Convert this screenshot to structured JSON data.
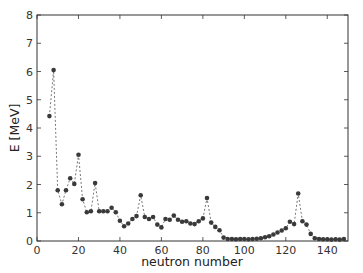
{
  "chart_data": {
    "type": "line",
    "title": "",
    "xlabel": "neutron number",
    "ylabel": "E [MeV]",
    "xlim": [
      0,
      150
    ],
    "ylim": [
      0,
      8
    ],
    "xticks": [
      0,
      20,
      40,
      60,
      80,
      100,
      120,
      140
    ],
    "yticks": [
      0,
      1,
      2,
      3,
      4,
      5,
      6,
      7,
      8
    ],
    "grid": false,
    "legend": null,
    "line_style": "dashed",
    "marker": "circle",
    "series": [
      {
        "name": "E",
        "x": [
          6,
          8,
          10,
          12,
          14,
          16,
          18,
          20,
          22,
          24,
          26,
          28,
          30,
          32,
          34,
          36,
          38,
          40,
          42,
          44,
          46,
          48,
          50,
          52,
          54,
          56,
          58,
          60,
          62,
          64,
          66,
          68,
          70,
          72,
          74,
          76,
          78,
          80,
          82,
          84,
          86,
          88,
          90,
          92,
          94,
          96,
          98,
          100,
          102,
          104,
          106,
          108,
          110,
          112,
          114,
          116,
          118,
          120,
          122,
          124,
          126,
          128,
          130,
          132,
          134,
          136,
          138,
          140,
          142,
          144,
          146,
          148
        ],
        "y": [
          4.42,
          6.05,
          1.8,
          1.3,
          1.8,
          2.22,
          2.02,
          3.05,
          1.48,
          1.02,
          1.05,
          2.05,
          1.05,
          1.05,
          1.05,
          1.18,
          1.02,
          0.72,
          0.52,
          0.62,
          0.78,
          0.88,
          1.62,
          0.85,
          0.78,
          0.85,
          0.58,
          0.48,
          0.78,
          0.75,
          0.9,
          0.75,
          0.68,
          0.7,
          0.62,
          0.6,
          0.7,
          0.8,
          1.52,
          0.65,
          0.5,
          0.38,
          0.12,
          0.07,
          0.07,
          0.06,
          0.07,
          0.07,
          0.06,
          0.07,
          0.08,
          0.1,
          0.13,
          0.17,
          0.23,
          0.3,
          0.37,
          0.45,
          0.68,
          0.6,
          1.68,
          0.7,
          0.58,
          0.25,
          0.1,
          0.07,
          0.06,
          0.06,
          0.05,
          0.06,
          0.05,
          0.07
        ]
      }
    ]
  },
  "axes": {
    "xlabel": "neutron number",
    "ylabel": "E [MeV]",
    "xtick_labels": [
      "0",
      "20",
      "40",
      "60",
      "80",
      "100",
      "120",
      "140"
    ],
    "ytick_labels": [
      "0",
      "1",
      "2",
      "3",
      "4",
      "5",
      "6",
      "7",
      "8"
    ]
  },
  "colors": {
    "marker": "#3a3a3a",
    "line": "#555555",
    "frame": "#333333"
  }
}
